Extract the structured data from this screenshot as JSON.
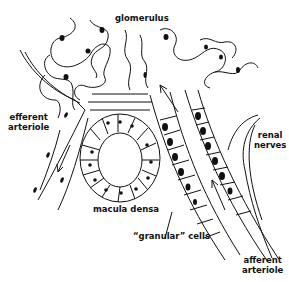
{
  "diagram": {
    "colors": {
      "ink": "#111111",
      "background": "#ffffff"
    },
    "labels": {
      "glomerulus": "glomerulus",
      "efferent_line1": "efferent",
      "efferent_line2": "arteriole",
      "renal_line1": "renal",
      "renal_line2": "nerves",
      "macula_densa": "macula densa",
      "granular_cells": "“granular” cells",
      "afferent_line1": "afferent",
      "afferent_line2": "arteriole"
    },
    "flow_arrows": [
      {
        "name": "efferent-flow",
        "direction": "down"
      },
      {
        "name": "afferent-flow-upper",
        "direction": "up"
      },
      {
        "name": "afferent-flow-lower",
        "direction": "up"
      }
    ]
  }
}
